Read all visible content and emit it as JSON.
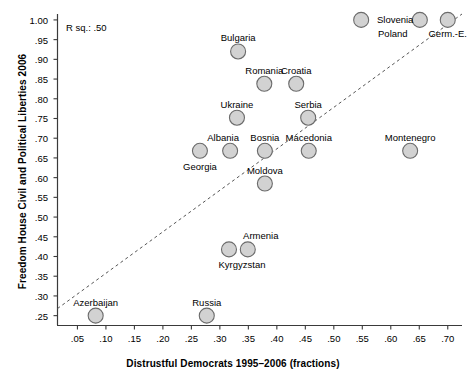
{
  "chart_data": {
    "type": "scatter",
    "title": "",
    "xlabel": "Distrustful Democrats 1995–2006 (fractions)",
    "ylabel": "Freedom House Civil and Political Liberties 2006",
    "xlim": [
      0.015,
      0.725
    ],
    "ylim": [
      0.225,
      1.015
    ],
    "xticks": [
      0.05,
      0.1,
      0.15,
      0.2,
      0.25,
      0.3,
      0.35,
      0.4,
      0.45,
      0.5,
      0.55,
      0.6,
      0.65,
      0.7
    ],
    "xticklabels": [
      ".05",
      ".10",
      ".15",
      ".20",
      ".25",
      ".30",
      ".35",
      ".40",
      ".45",
      ".50",
      ".55",
      ".60",
      ".65",
      ".70"
    ],
    "yticks": [
      0.25,
      0.3,
      0.35,
      0.4,
      0.45,
      0.5,
      0.55,
      0.6,
      0.65,
      0.7,
      0.75,
      0.8,
      0.85,
      0.9,
      0.95,
      1.0
    ],
    "yticklabels": [
      ".25",
      ".30",
      ".35",
      ".40",
      ".45",
      ".50",
      ".55",
      ".60",
      ".65",
      ".70",
      ".75",
      ".80",
      ".85",
      ".90",
      ".95",
      "1.00"
    ],
    "grid": false,
    "legend": null,
    "annotations": [
      {
        "name": "r-squared",
        "text": "R sq.: .50",
        "x": 0.055,
        "y": 0.975
      }
    ],
    "trendline": {
      "style": "dashed",
      "color": "#555555",
      "x0": 0.015,
      "y0": 0.268,
      "x1": 0.725,
      "y1": 1.015
    },
    "marker": {
      "shape": "circle",
      "fill": "#d2d2d2",
      "edge": "#6b6b6b",
      "size": 15
    },
    "points": [
      {
        "label": "Slovenia",
        "x": 0.548,
        "y": 1.0,
        "label_dx": 34,
        "label_dy": 0
      },
      {
        "label": "Poland",
        "x": 0.651,
        "y": 1.0,
        "label_dx": -27,
        "label_dy": 14
      },
      {
        "label": "Germ.-E.",
        "x": 0.7,
        "y": 1.0,
        "label_dx": 0,
        "label_dy": 14
      },
      {
        "label": "Bulgaria",
        "x": 0.332,
        "y": 0.92,
        "label_dx": 0,
        "label_dy": -13
      },
      {
        "label": "Romania",
        "x": 0.378,
        "y": 0.838,
        "label_dx": 0,
        "label_dy": -13
      },
      {
        "label": "Croatia",
        "x": 0.434,
        "y": 0.838,
        "label_dx": 0,
        "label_dy": -13
      },
      {
        "label": "Ukraine",
        "x": 0.33,
        "y": 0.752,
        "label_dx": 0,
        "label_dy": -13
      },
      {
        "label": "Serbia",
        "x": 0.455,
        "y": 0.752,
        "label_dx": 0,
        "label_dy": -13
      },
      {
        "label": "Albania",
        "x": 0.318,
        "y": 0.668,
        "label_dx": -7,
        "label_dy": -13
      },
      {
        "label": "Bosnia",
        "x": 0.379,
        "y": 0.668,
        "label_dx": 0,
        "label_dy": -13
      },
      {
        "label": "Macedonia",
        "x": 0.456,
        "y": 0.668,
        "label_dx": 0,
        "label_dy": -13
      },
      {
        "label": "Montenegro",
        "x": 0.634,
        "y": 0.668,
        "label_dx": 0,
        "label_dy": -13
      },
      {
        "label": "Georgia",
        "x": 0.265,
        "y": 0.668,
        "label_dx": 0,
        "label_dy": 16
      },
      {
        "label": "Moldova",
        "x": 0.379,
        "y": 0.585,
        "label_dx": 0,
        "label_dy": -13
      },
      {
        "label": "Armenia",
        "x": 0.349,
        "y": 0.418,
        "label_dx": 13,
        "label_dy": -13
      },
      {
        "label": "Kyrgyzstan",
        "x": 0.316,
        "y": 0.418,
        "label_dx": 13,
        "label_dy": 16
      },
      {
        "label": "Azerbaijan",
        "x": 0.082,
        "y": 0.25,
        "label_dx": 0,
        "label_dy": -13
      },
      {
        "label": "Russia",
        "x": 0.277,
        "y": 0.25,
        "label_dx": 0,
        "label_dy": -13
      }
    ]
  }
}
